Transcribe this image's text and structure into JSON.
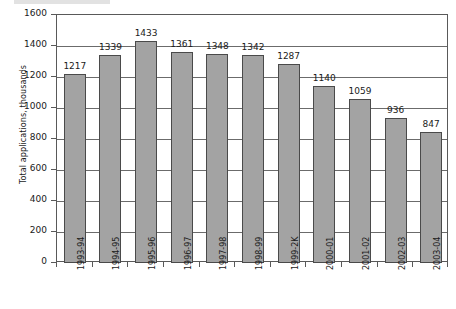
{
  "chart_data": {
    "type": "bar",
    "title": "",
    "subtitle": "",
    "xlabel": "",
    "ylabel": "Total applications, thousands",
    "ylim": [
      0,
      1600
    ],
    "ytick_step": 200,
    "yticks": [
      "0",
      "200",
      "400",
      "600",
      "800",
      "1000",
      "1200",
      "1400",
      "1600"
    ],
    "grid": "horizontal",
    "legend": "none",
    "bar_color": "#a3a3a3",
    "bar_border_color": "#4a4a4a",
    "axis_color": "#595959",
    "categories": [
      "1993-94",
      "1994-95",
      "1995-96",
      "1996-97",
      "1997-98",
      "1998-99",
      "1999-2K",
      "2000-01",
      "2001-02",
      "2002-03",
      "2003-04"
    ],
    "values": [
      1217,
      1339,
      1433,
      1361,
      1348,
      1342,
      1287,
      1140,
      1059,
      936,
      847
    ],
    "data_labels": [
      "1217",
      "1339",
      "1433",
      "1361",
      "1348",
      "1342",
      "1287",
      "1140",
      "1059",
      "936",
      "847"
    ]
  }
}
